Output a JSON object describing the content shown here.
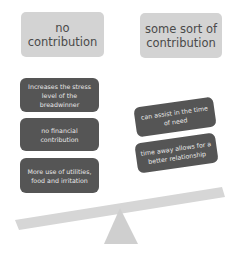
{
  "headers": {
    "left": "no contribution",
    "right": "some sort of contribution"
  },
  "left_items": [
    "Increases the stress level of the breadwinner",
    "no financial contribution",
    "More use of utilities, food and irritation"
  ],
  "right_items": [
    "can assist in the time of need",
    "time away allows for a better relationship"
  ],
  "colors": {
    "header_bg": "#d3d3d3",
    "item_bg": "#555555",
    "beam": "#d6d6d6",
    "fulcrum": "#cfcfcf"
  }
}
